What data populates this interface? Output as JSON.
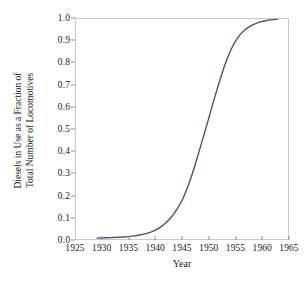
{
  "chart_data": {
    "type": "line",
    "title": "",
    "xlabel": "Year",
    "ylabel_lines": [
      "Diesels in Use as a Fraction of",
      "Total Number of Locomotives"
    ],
    "ylabel": "Diesels in Use as a Fraction of Total Number of Locomotives",
    "xlim": [
      1925,
      1965
    ],
    "ylim": [
      0.0,
      1.0
    ],
    "grid": false,
    "legend": null,
    "line_color": "#4a4f7a",
    "frame_color": "#c9c9c9",
    "xticks": [
      1925,
      1930,
      1935,
      1940,
      1945,
      1950,
      1955,
      1960,
      1965
    ],
    "xtick_labels": [
      "1925",
      "1930",
      "1935",
      "1940",
      "1945",
      "1950",
      "1955",
      "1960",
      "1965"
    ],
    "yticks": [
      0.0,
      0.1,
      0.2,
      0.3,
      0.4,
      0.5,
      0.6,
      0.7,
      0.8,
      0.9,
      1.0
    ],
    "ytick_labels": [
      "0.0",
      "0.1",
      "0.2",
      "0.3",
      "0.4",
      "0.5",
      "0.6",
      "0.7",
      "0.8",
      "0.9",
      "1.0"
    ],
    "series": [
      {
        "name": "Diesel fraction",
        "x": [
          1929,
          1930,
          1931,
          1932,
          1933,
          1934,
          1935,
          1936,
          1937,
          1938,
          1939,
          1940,
          1941,
          1942,
          1943,
          1944,
          1945,
          1946,
          1947,
          1948,
          1949,
          1950,
          1951,
          1952,
          1953,
          1954,
          1955,
          1956,
          1957,
          1958,
          1959,
          1960,
          1961,
          1962,
          1963
        ],
        "y": [
          0.004,
          0.005,
          0.006,
          0.007,
          0.008,
          0.009,
          0.011,
          0.014,
          0.018,
          0.023,
          0.03,
          0.04,
          0.055,
          0.075,
          0.1,
          0.133,
          0.175,
          0.232,
          0.3,
          0.38,
          0.462,
          0.545,
          0.63,
          0.71,
          0.785,
          0.848,
          0.895,
          0.93,
          0.953,
          0.969,
          0.98,
          0.988,
          0.993,
          0.997,
          0.999
        ]
      }
    ]
  }
}
